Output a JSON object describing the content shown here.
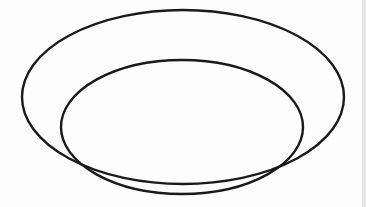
{
  "diagram": {
    "type": "euler-nested-ellipses",
    "background": "#fdfdfd",
    "stroke_color": "#1a1a1a",
    "stroke_width": 2.4,
    "edge_strip_color": "#e6e6e6",
    "shapes": [
      {
        "id": "outer-ellipse",
        "cx": 183,
        "cy": 97,
        "rx": 161,
        "ry": 87
      },
      {
        "id": "inner-ellipse",
        "cx": 182,
        "cy": 127,
        "rx": 121,
        "ry": 67
      }
    ]
  }
}
